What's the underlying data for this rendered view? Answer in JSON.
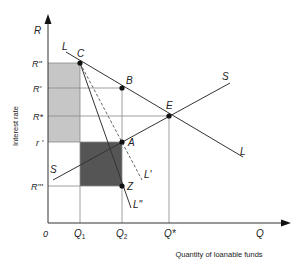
{
  "diagram": {
    "type": "loanable-funds-market",
    "axes": {
      "y_symbol": "R",
      "x_symbol": "Q",
      "origin": "0",
      "y_title": "Interest rate",
      "x_title": "Quantity of loanable funds"
    },
    "y_ticks": {
      "r_double_prime": "R\"",
      "r_prime": "R'",
      "r_star": "R*",
      "r_small_prime": "r '",
      "r_triple_prime": "R'''"
    },
    "x_ticks": {
      "q1": "Q",
      "q1_sub": "1",
      "q2": "Q",
      "q2_sub": "2",
      "q_star": "Q*"
    },
    "points": {
      "c": "C",
      "b": "B",
      "e": "E",
      "a": "A",
      "z": "Z"
    },
    "curves": {
      "supply_left": "S",
      "supply_right": "S",
      "demand_left": "L",
      "demand_right": "L",
      "demand_dashed": "L'",
      "demand_steep": "L\""
    },
    "colors": {
      "light_area": "#c6c6c6",
      "dark_area": "#555555",
      "line": "#333333",
      "grid": "#888888"
    }
  }
}
